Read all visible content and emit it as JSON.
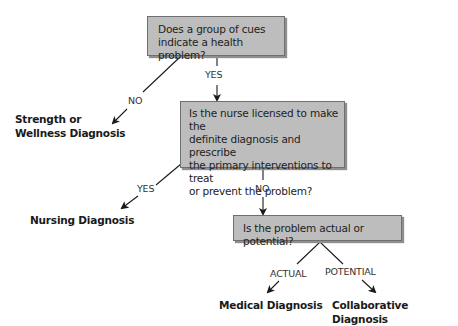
{
  "diagram": {
    "nodes": {
      "q1": {
        "text": "Does a group of cues indicate a health problem?",
        "lines": [
          "Does a group of cues",
          "indicate a health problem?"
        ]
      },
      "q2": {
        "text": "Is the nurse licensed to make the definite diagnosis and prescribe the primary interventions to treat or prevent the problem?",
        "lines": [
          "Is the nurse licensed to make the",
          "definite diagnosis and prescribe",
          "the primary interventions to treat",
          "or prevent the problem?"
        ]
      },
      "q3": {
        "text": "Is the problem actual or potential?",
        "lines": [
          "Is the problem actual or potential?"
        ]
      }
    },
    "outcomes": {
      "strength": {
        "lines": [
          "Strength or",
          "Wellness Diagnosis"
        ]
      },
      "nursing": {
        "label": "Nursing Diagnosis"
      },
      "medical": {
        "label": "Medical Diagnosis"
      },
      "collaborative": {
        "label": "Collaborative Diagnosis"
      }
    },
    "edges": {
      "q1_no": "NO",
      "q1_yes": "YES",
      "q2_yes": "YES",
      "q2_no": "NO",
      "q3_actual": "ACTUAL",
      "q3_potential": "POTENTIAL"
    },
    "colors": {
      "box_fill": "#bdbdbd",
      "box_border": "#6f6f6f",
      "line": "#1a1a1a"
    }
  }
}
